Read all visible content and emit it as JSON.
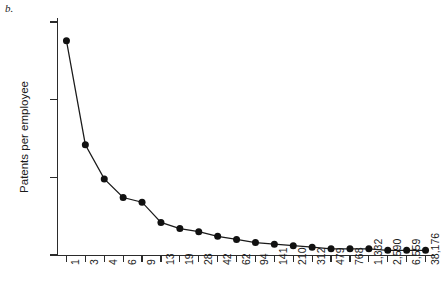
{
  "figure": {
    "panel_label": "b.",
    "background_color": "#ffffff",
    "ink_color": "#1a1a1a"
  },
  "chart_data": {
    "type": "line",
    "title": "",
    "subtitle": "",
    "xlabel": "",
    "ylabel": "Patents per employee",
    "categories": [
      "1",
      "3",
      "4",
      "6",
      "9",
      "13",
      "19",
      "28",
      "42",
      "62",
      "94",
      "141",
      "210",
      "312",
      "479",
      "768",
      "1,332",
      "2,590",
      "6,559",
      "38,176"
    ],
    "values": [
      1.38,
      0.71,
      0.49,
      0.37,
      0.34,
      0.21,
      0.17,
      0.15,
      0.12,
      0.1,
      0.08,
      0.07,
      0.06,
      0.05,
      0.04,
      0.04,
      0.04,
      0.03,
      0.03,
      0.03
    ],
    "series": [
      {
        "name": "Patents per employee",
        "values": [
          1.38,
          0.71,
          0.49,
          0.37,
          0.34,
          0.21,
          0.17,
          0.15,
          0.12,
          0.1,
          0.08,
          0.07,
          0.06,
          0.05,
          0.04,
          0.04,
          0.04,
          0.03,
          0.03,
          0.03
        ]
      }
    ],
    "ylim": [
      0,
      1.5
    ],
    "yticks": [
      0,
      0.5,
      1,
      1.5
    ],
    "ytick_labels": [
      "0",
      "0.5",
      "1",
      "1.5"
    ],
    "grid": false,
    "legend": false,
    "legend_position": "none",
    "marker": "filled-circle",
    "line_color": "#1a1a1a",
    "marker_color": "#111111"
  }
}
